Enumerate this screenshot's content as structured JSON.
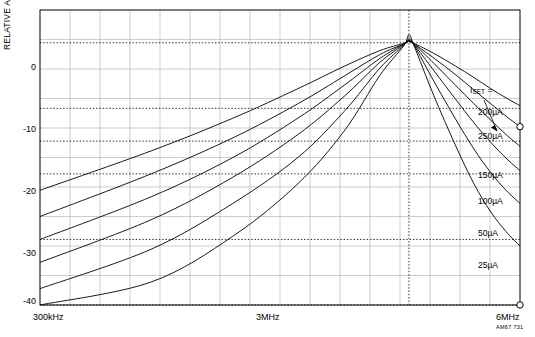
{
  "chart_data": {
    "type": "line",
    "title": "",
    "subtitle": "",
    "xlabel": "",
    "ylabel": "RELATIVE AMPLITUDE (dB)",
    "x_scale": "log",
    "xlim": [
      300000,
      6000000
    ],
    "ylim": [
      -40,
      5
    ],
    "y_ticks": [
      0,
      -10,
      -20,
      -30,
      -40
    ],
    "y_tick_labels": [
      "0",
      "-10",
      "-20",
      "-30",
      "-40"
    ],
    "x_ticks": [
      300000,
      3000000,
      6000000
    ],
    "x_tick_labels": [
      "300kHz",
      "3MHz",
      "6MHz"
    ],
    "grid": true,
    "grid_minor": true,
    "legend_position": "right-inside",
    "legend_title": "ISET =",
    "annotations": [
      "AM67 731"
    ],
    "series": [
      {
        "name": "200µA",
        "label": "200µA",
        "x": [
          300000,
          600000,
          1000000,
          1500000,
          2000000,
          2500000,
          2900000,
          3000000,
          3100000,
          3500000,
          4000000,
          4500000,
          5000000,
          5500000,
          6000000
        ],
        "y": [
          -22.5,
          -16.5,
          -11.5,
          -7.0,
          -3.6,
          -1.2,
          -0.1,
          0.2,
          -0.1,
          -1.6,
          -3.5,
          -5.3,
          -7.0,
          -8.4,
          -9.6
        ]
      },
      {
        "name": "250µA",
        "label": "250µA",
        "x": [
          300000,
          600000,
          1000000,
          1500000,
          2000000,
          2500000,
          2900000,
          3000000,
          3100000,
          3500000,
          4000000,
          4500000,
          5000000,
          5500000,
          6000000
        ],
        "y": [
          -26.5,
          -20.0,
          -14.5,
          -9.3,
          -5.1,
          -1.8,
          -0.2,
          0.2,
          -0.2,
          -2.3,
          -4.8,
          -7.2,
          -9.3,
          -11.2,
          -12.8
        ]
      },
      {
        "name": "150µA",
        "label": "150µA",
        "x": [
          300000,
          600000,
          1000000,
          1500000,
          2000000,
          2500000,
          2900000,
          3000000,
          3100000,
          3500000,
          4000000,
          4500000,
          5000000,
          5500000,
          6000000
        ],
        "y": [
          -30.0,
          -23.5,
          -17.5,
          -11.5,
          -6.5,
          -2.4,
          -0.2,
          0.3,
          -0.2,
          -3.1,
          -6.4,
          -9.3,
          -11.8,
          -14.0,
          -15.8
        ]
      },
      {
        "name": "100µA",
        "label": "100µA",
        "x": [
          300000,
          600000,
          1000000,
          1500000,
          2000000,
          2500000,
          2900000,
          3000000,
          3100000,
          3500000,
          4000000,
          4500000,
          5000000,
          5500000,
          6000000
        ],
        "y": [
          -33.5,
          -27.0,
          -20.5,
          -14.0,
          -8.2,
          -3.0,
          -0.3,
          0.4,
          -0.3,
          -4.2,
          -8.5,
          -12.2,
          -15.2,
          -17.6,
          -19.5
        ]
      },
      {
        "name": "50µA",
        "label": "50µA",
        "x": [
          300000,
          600000,
          1000000,
          1500000,
          2000000,
          2500000,
          2900000,
          3000000,
          3100000,
          3500000,
          4000000,
          4500000,
          5000000,
          5500000,
          6000000
        ],
        "y": [
          -37.5,
          -31.5,
          -24.5,
          -17.5,
          -10.5,
          -3.9,
          -0.4,
          0.6,
          -0.4,
          -5.8,
          -11.5,
          -16.2,
          -19.8,
          -22.5,
          -24.5
        ]
      },
      {
        "name": "25µA",
        "label": "25µA",
        "x": [
          300000,
          600000,
          1000000,
          1500000,
          2000000,
          2500000,
          2900000,
          3000000,
          3100000,
          3500000,
          4000000,
          4500000,
          5000000,
          5500000,
          6000000
        ],
        "y": [
          -40.0,
          -36.5,
          -29.5,
          -21.5,
          -13.5,
          -5.0,
          -0.5,
          1.2,
          -0.5,
          -8.0,
          -15.5,
          -21.5,
          -25.8,
          -28.8,
          -31.0
        ]
      }
    ]
  },
  "labels": {
    "y_axis_title": "RELATIVE AMPLITUDE (dB)",
    "y_0": "0",
    "y_10": "-10",
    "y_20": "-20",
    "y_30": "-30",
    "y_40": "-40",
    "x_left": "300kHz",
    "x_mid": "3MHz",
    "x_right": "6MHz",
    "iset_title_main": "I",
    "iset_title_sub": "SET",
    "iset_title_eq": " =",
    "curve_200": "200µA",
    "curve_250": "250µA",
    "curve_150": "150µA",
    "curve_100": "100µA",
    "curve_50": "50µA",
    "curve_25": "25µA",
    "figure_number": "AM67 731"
  }
}
